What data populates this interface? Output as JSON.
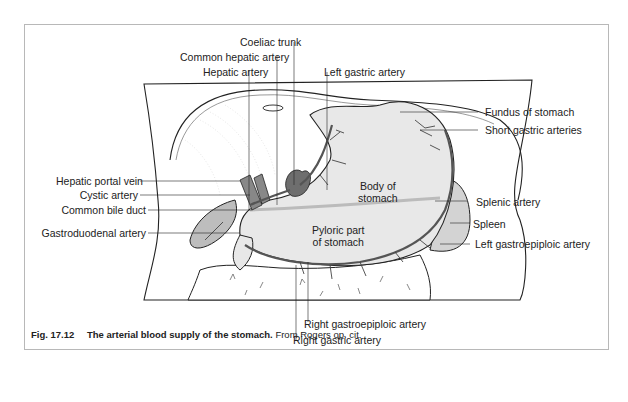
{
  "figure": {
    "number": "Fig. 17.12",
    "title": "The arterial blood supply of the stomach.",
    "source": "From Rogers op. cit."
  },
  "labels": {
    "coeliac_trunk": "Coeliac trunk",
    "common_hepatic_artery": "Common hepatic artery",
    "hepatic_artery": "Hepatic artery",
    "left_gastric_artery": "Left gastric artery",
    "fundus_of_stomach": "Fundus of stomach",
    "short_gastric_arteries": "Short gastric arteries",
    "hepatic_portal_vein": "Hepatic portal vein",
    "cystic_artery": "Cystic artery",
    "common_bile_duct": "Common bile duct",
    "gastroduodenal_artery": "Gastroduodenal artery",
    "body_of_stomach_1": "Body of",
    "body_of_stomach_2": "stomach",
    "pyloric_part_1": "Pyloric part",
    "pyloric_part_2": "of stomach",
    "splenic_artery": "Splenic artery",
    "spleen": "Spleen",
    "left_gastroepiploic_artery": "Left gastroepiploic artery",
    "right_gastroepiploic_artery": "Right gastroepiploic artery",
    "right_gastric_artery": "Right gastric artery"
  },
  "colors": {
    "line": "#222222",
    "organ_fill": "#e6e6e6",
    "gallbladder_fill": "#bdbdbd",
    "vessel_fill": "#6e6e6e",
    "frame_border": "#b8b8b8"
  }
}
